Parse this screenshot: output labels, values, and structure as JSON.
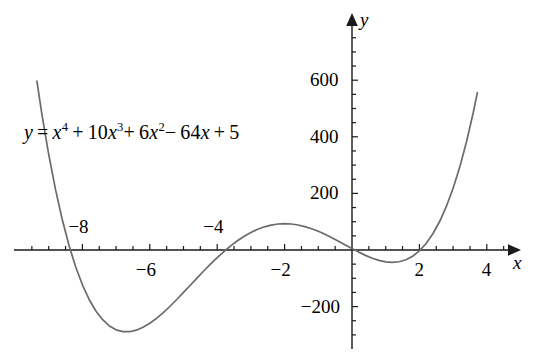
{
  "figure": {
    "equation_plain": "y = x^4 + 10x^3 + 6x^2 - 64x + 5",
    "equation_parts": {
      "lhs": "y",
      "equals": "=",
      "t1_base": "x",
      "t1_exp": "4",
      "op1": "+",
      "t2_coef": "10",
      "t2_base": "x",
      "t2_exp": "3",
      "op2": "+",
      "t3_coef": "6",
      "t3_base": "x",
      "t3_exp": "2",
      "op3": "−",
      "t4_coef": "64",
      "t4_base": "x",
      "op4": "+",
      "t5_const": "5"
    },
    "x_axis_name": "x",
    "y_axis_name": "y",
    "curve_color": "#6b6b6b",
    "axis_color": "#1a1a1a",
    "text_color": "#000000"
  },
  "chart_data": {
    "type": "line",
    "title": "",
    "subtitle": "",
    "xlabel": "x",
    "ylabel": "y",
    "annotations": [
      {
        "text": "y = x⁴ + 10x³ + 6x² − 64x + 5",
        "x_px": 24,
        "y_px": 122
      }
    ],
    "legend": [],
    "legend_position": "none",
    "grid": false,
    "xlim": [
      -10.4,
      5.2
    ],
    "ylim": [
      -310,
      780
    ],
    "x_major_ticks": [
      -8,
      -6,
      -4,
      -2,
      2,
      4
    ],
    "x_major_tick_labels": [
      "−8",
      "−6",
      "−4",
      "−2",
      "2",
      "4"
    ],
    "x_label_side": [
      "above",
      "below",
      "above",
      "below",
      "below",
      "below"
    ],
    "x_minor_tick_step": 0.5,
    "y_major_ticks": [
      -200,
      200,
      400,
      600
    ],
    "y_major_tick_labels": [
      "−200",
      "200",
      "400",
      "600"
    ],
    "y_minor_tick_step": 50,
    "series": [
      {
        "name": "y = x^4 + 10x^3 + 6x^2 - 64x + 5",
        "color": "#6b6b6b",
        "x": [
          -9.35,
          -9.2,
          -9.0,
          -8.8,
          -8.6,
          -8.4,
          -8.2,
          -8.0,
          -7.8,
          -7.6,
          -7.4,
          -7.2,
          -7.0,
          -6.8,
          -6.6,
          -6.4,
          -6.2,
          -6.0,
          -5.8,
          -5.6,
          -5.4,
          -5.2,
          -5.0,
          -4.8,
          -4.6,
          -4.4,
          -4.2,
          -4.0,
          -3.8,
          -3.6,
          -3.4,
          -3.2,
          -3.0,
          -2.8,
          -2.6,
          -2.4,
          -2.2,
          -2.0,
          -1.8,
          -1.6,
          -1.4,
          -1.2,
          -1.0,
          -0.8,
          -0.6,
          -0.4,
          -0.2,
          0.0,
          0.2,
          0.4,
          0.6,
          0.8,
          1.0,
          1.2,
          1.4,
          1.6,
          1.8,
          2.0,
          2.2,
          2.4,
          2.6,
          2.8,
          3.0,
          3.2,
          3.4,
          3.6,
          3.72
        ],
        "y": [
          772.6,
          629.1,
          455.0,
          299.2,
          160.7,
          38.3,
          -68.6,
          -160.8,
          -239.0,
          -303.9,
          -356.2,
          -396.5,
          -425.4,
          -443.5,
          -451.4,
          -449.7,
          -438.9,
          -419.6,
          -392.3,
          -357.6,
          -316.0,
          -268.1,
          -214.4,
          -155.5,
          -91.9,
          -24.3,
          46.9,
          121.0,
          197.4,
          275.8,
          355.5,
          436.3,
          517.5,
          598.9,
          679.9,
          760.2,
          839.5,
          917.1,
          993.0,
          1066.5,
          1137.3,
          1205.1,
          1269.5,
          1330.3,
          1387.1,
          1439.7,
          1487.8,
          1531.2,
          1569.6,
          1602.9,
          1631.0,
          1653.6,
          1670.9,
          1682.7,
          1689.1,
          1690.3,
          1686.4,
          1677.6,
          1664.3,
          1646.8,
          1625.5,
          1600.9,
          1573.6,
          1544.3,
          1513.6,
          1482.4,
          1464.3
        ],
        "note": "values_are_unscaled_polynomial_evaluations"
      }
    ],
    "roots_visible": [
      -8.12,
      -3.93,
      0.08,
      1.97
    ],
    "local_extrema": {
      "local_min_left": {
        "x": -6.6,
        "y": -452
      },
      "local_max_middle": {
        "x": -2.1,
        "y": 96
      },
      "local_min_right": {
        "x": 1.2,
        "y": -52
      }
    }
  }
}
